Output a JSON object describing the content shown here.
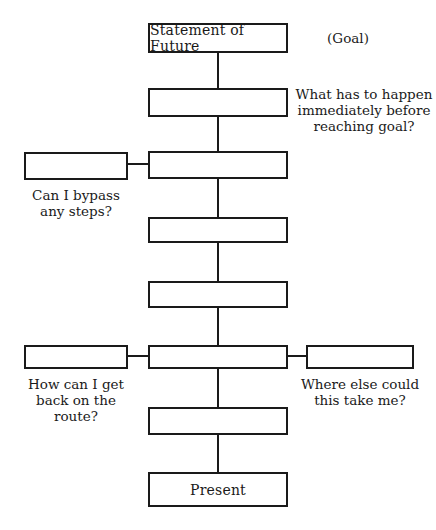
{
  "diagram": {
    "goal_box": "Statement of Future",
    "goal_tag": "(Goal)",
    "present_box": "Present",
    "questions": {
      "before_goal": "What has to happen\nimmediately before\nreaching goal?",
      "bypass": "Can I bypass\nany steps?",
      "back_on_route": "How can I get\nback on the\nroute?",
      "where_else": "Where else could\nthis take me?"
    },
    "steps": [
      "",
      "",
      "",
      "",
      "",
      ""
    ],
    "side_boxes": [
      "",
      "",
      ""
    ]
  }
}
